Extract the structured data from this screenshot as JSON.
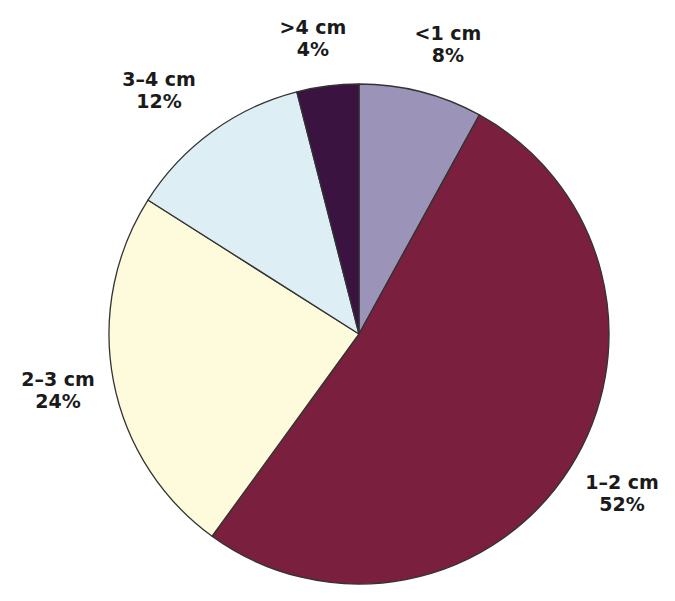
{
  "chart_data": {
    "type": "pie",
    "title": "",
    "start_angle_deg": 0,
    "direction": "clockwise",
    "center": [
      359,
      334
    ],
    "radius": 250,
    "slices": [
      {
        "label": "<1 cm",
        "value": 8,
        "pct_label": "8%",
        "color": "#9b93b8",
        "label_pos": [
          448,
          22
        ]
      },
      {
        "label": "1–2 cm",
        "value": 52,
        "pct_label": "52%",
        "color": "#7a1f3d",
        "label_pos": [
          622,
          471
        ]
      },
      {
        "label": "2–3 cm",
        "value": 24,
        "pct_label": "24%",
        "color": "#fdfbdc",
        "label_pos": [
          58,
          368
        ]
      },
      {
        "label": "3–4 cm",
        "value": 12,
        "pct_label": "12%",
        "color": "#ddeef5",
        "label_pos": [
          159,
          68
        ]
      },
      {
        "label": ">4 cm",
        "value": 4,
        "pct_label": "4%",
        "color": "#3a1340",
        "label_pos": [
          313,
          16
        ]
      }
    ],
    "stroke_color": "#333333"
  }
}
